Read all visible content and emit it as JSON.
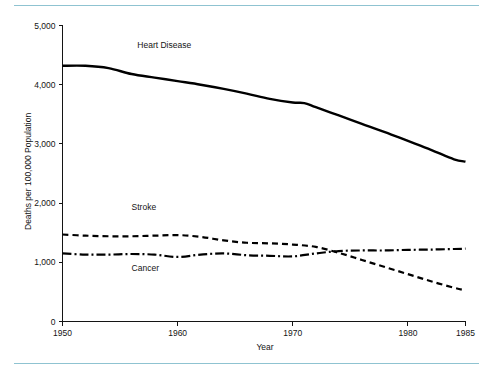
{
  "figure": {
    "accent_rule_color": "#8fc3d1",
    "background_color": "#ffffff",
    "line_color": "#000000",
    "text_color": "#141414"
  },
  "chart_data": {
    "type": "line",
    "title": "",
    "xlabel": "Year",
    "ylabel": "Deaths per 100,000 Population",
    "xlim": [
      1950,
      1985
    ],
    "ylim": [
      0,
      5000
    ],
    "xticks": [
      1950,
      1960,
      1970,
      1980,
      1985
    ],
    "xticklabels": [
      "1950",
      "1960",
      "1970",
      "1980",
      "1985"
    ],
    "yticks": [
      0,
      1000,
      2000,
      3000,
      4000,
      5000
    ],
    "yticklabels": [
      "0",
      "1,000",
      "2,000",
      "3,000",
      "4,000",
      "5,000"
    ],
    "grid": false,
    "legend": "inline-labels",
    "annotations": [
      {
        "text": "Heart Disease",
        "x": 1956.5,
        "y": 4620
      },
      {
        "text": "Stroke",
        "x": 1956.0,
        "y": 1880
      },
      {
        "text": "Cancer",
        "x": 1956.0,
        "y": 860
      }
    ],
    "series": [
      {
        "name": "Heart Disease",
        "style": "solid",
        "x": [
          1950,
          1952,
          1954,
          1956,
          1958,
          1960,
          1962,
          1964,
          1966,
          1968,
          1970,
          1971,
          1972,
          1974,
          1976,
          1978,
          1980,
          1982,
          1984,
          1985
        ],
        "values": [
          4320,
          4320,
          4280,
          4180,
          4120,
          4060,
          4000,
          3930,
          3850,
          3760,
          3700,
          3690,
          3620,
          3480,
          3340,
          3200,
          3050,
          2900,
          2740,
          2700
        ]
      },
      {
        "name": "Stroke",
        "style": "dashed",
        "x": [
          1950,
          1952,
          1954,
          1956,
          1958,
          1960,
          1962,
          1964,
          1966,
          1968,
          1970,
          1972,
          1974,
          1976,
          1978,
          1980,
          1982,
          1984,
          1985
        ],
        "values": [
          1470,
          1450,
          1440,
          1440,
          1450,
          1460,
          1430,
          1370,
          1330,
          1320,
          1300,
          1260,
          1160,
          1040,
          920,
          800,
          680,
          570,
          525
        ]
      },
      {
        "name": "Cancer",
        "style": "dash-dot",
        "x": [
          1950,
          1952,
          1954,
          1956,
          1958,
          1960,
          1962,
          1964,
          1966,
          1968,
          1970,
          1972,
          1974,
          1976,
          1978,
          1980,
          1982,
          1984,
          1985
        ],
        "values": [
          1150,
          1130,
          1130,
          1140,
          1130,
          1090,
          1130,
          1150,
          1120,
          1110,
          1100,
          1150,
          1190,
          1200,
          1200,
          1210,
          1215,
          1225,
          1230
        ]
      }
    ]
  }
}
